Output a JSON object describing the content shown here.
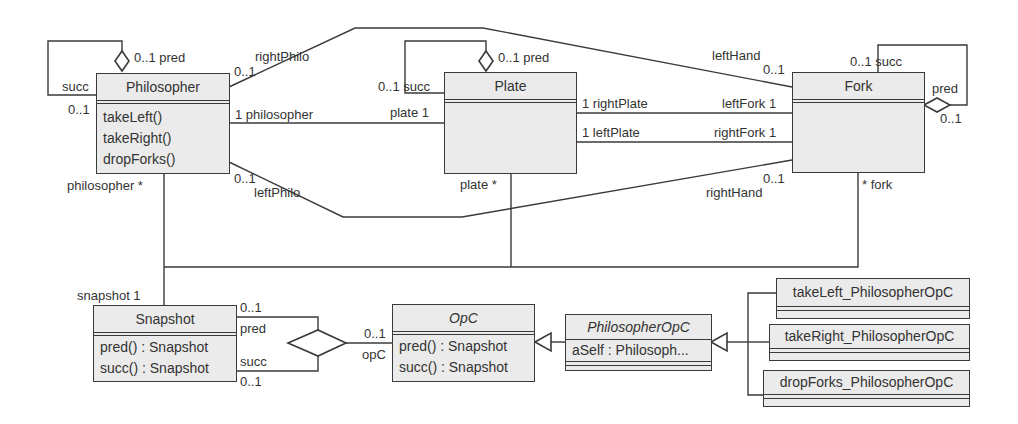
{
  "diagram": {
    "type": "UML class diagram"
  },
  "classes": {
    "philosopher": {
      "name": "Philosopher",
      "operations": [
        "takeLeft()",
        "takeRight()",
        "dropForks()"
      ]
    },
    "plate": {
      "name": "Plate",
      "operations": []
    },
    "fork": {
      "name": "Fork",
      "operations": []
    },
    "snapshot": {
      "name": "Snapshot",
      "operations": [
        "pred() : Snapshot",
        "succ() : Snapshot"
      ]
    },
    "opc": {
      "name": "OpC",
      "abstract": true,
      "operations": [
        "pred() : Snapshot",
        "succ() : Snapshot"
      ]
    },
    "philosopher_opc": {
      "name": "PhilosopherOpC",
      "abstract": true,
      "attributes": [
        "aSelf : Philosoph..."
      ]
    },
    "take_left_opc": {
      "name": "takeLeft_PhilosopherOpC"
    },
    "take_right_opc": {
      "name": "takeRight_PhilosopherOpC"
    },
    "drop_forks_opc": {
      "name": "dropForks_PhilosopherOpC"
    }
  },
  "labels": {
    "philo_self_pred": "0..1 pred",
    "philo_self_succ": "succ",
    "philo_self_succ_mult": "0..1",
    "right_philo_role": "rightPhilo",
    "right_philo_mult": "0..1",
    "philosopher_role": "1 philosopher",
    "left_philo_mult": "0..1",
    "left_philo_role": "leftPhilo",
    "philosopher_star": "philosopher *",
    "plate_self_pred": "0..1 pred",
    "plate_self_succ": "0..1 succ",
    "plate_role": "plate 1",
    "right_plate_role": "1 rightPlate",
    "left_plate_role": "1 leftPlate",
    "plate_star": "plate *",
    "left_hand_role": "leftHand",
    "left_hand_mult": "0..1",
    "fork_self_succ": "0..1 succ",
    "fork_self_pred": "pred",
    "fork_self_pred_mult": "0..1",
    "left_fork_role": "leftFork 1",
    "right_fork_role": "rightFork 1",
    "right_hand_mult": "0..1",
    "right_hand_role": "rightHand",
    "fork_star": "* fork",
    "snapshot_role": "snapshot  1",
    "snap_pred_mult": "0..1",
    "snap_pred_role": "pred",
    "snap_succ_role": "succ",
    "snap_succ_mult": "0..1",
    "opc_mult": "0..1",
    "opc_role": "opC"
  }
}
